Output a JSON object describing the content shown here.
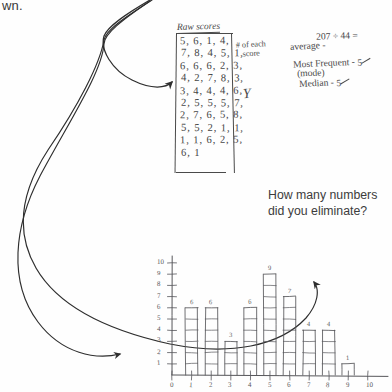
{
  "page": {
    "cut_off_text": "wn.",
    "background_color": "#fefefe",
    "ink_color": "#4a4a4a"
  },
  "raw_scores": {
    "title": "Raw scores",
    "rows": [
      "5, 6, 1, 4,",
      "7, 8, 4, 5, 1,",
      "6, 6, 6, 2, 3,",
      "4, 2, 7, 8, 3,",
      "3, 4, 4, 4, 6,",
      "2, 5, 5, 5, 7,",
      "2, 7, 6, 5, 8,",
      "5, 5, 2, 1, 1,",
      "1, 1, 6, 2, 5,",
      "6, 1"
    ]
  },
  "annotations": {
    "count_each_score_line1": "# of each",
    "count_each_score_line2": "score",
    "y_axis_letter": "Y"
  },
  "statistics": {
    "sum_divide": "207 ÷ 44 =",
    "average_label": "average -",
    "most_frequent_label": "Most Frequent -",
    "most_frequent_value": "5",
    "mode_sublabel": "(mode)",
    "median_label": "Median -",
    "median_value": "5"
  },
  "question": {
    "line1": "How many numbers",
    "line2": "did you eliminate?"
  },
  "arrows": {
    "description": "three long curved arrows fanning out from a convergence point at upper-left",
    "count": 3,
    "color": "#2e2e2e"
  },
  "chart_data": {
    "type": "bar",
    "title": "",
    "xlabel": "",
    "ylabel": "",
    "categories": [
      "0",
      "1",
      "2",
      "3",
      "4",
      "5",
      "6",
      "7",
      "8",
      "9",
      "10"
    ],
    "values": [
      0,
      6,
      6,
      3,
      6,
      9,
      7,
      4,
      4,
      1,
      0
    ],
    "bar_labels": [
      "",
      "6",
      "6",
      "3",
      "6",
      "9",
      "7",
      "4",
      "4",
      "1",
      ""
    ],
    "x_tick_labels": [
      "0",
      "1",
      "2",
      "3",
      "4",
      "5",
      "6",
      "7",
      "8",
      "9",
      "10"
    ],
    "y_tick_labels": [
      "1",
      "2",
      "3",
      "4",
      "5",
      "6",
      "7",
      "8",
      "9",
      "10"
    ],
    "ylim": [
      0,
      10
    ],
    "grid": false,
    "legend": "none",
    "style": "hand-drawn stacked unit squares"
  }
}
